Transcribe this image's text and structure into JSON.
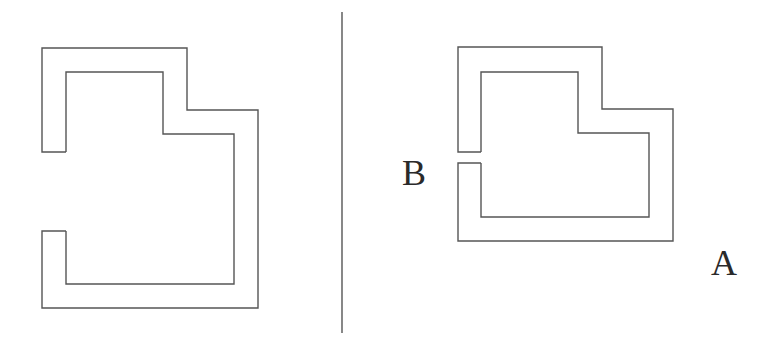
{
  "figure": {
    "width": 776,
    "height": 340,
    "background": "#ffffff",
    "stroke_color": "#555555",
    "label_color": "#2a2a2a"
  },
  "divider": {
    "x": 342,
    "y1": 12,
    "y2": 333
  },
  "shapes": [
    {
      "id": "left-channel-shape",
      "description": "Open-ended rectangular channel with a wide gap on the left side",
      "outer_points": "66,152 42,152 42,48 187,48 187,110 258,110 258,308 42,308 42,231 66,231",
      "inner_points": "66,152 66,72 163,72 163,134 234,134 234,284 66,284 66,231"
    },
    {
      "id": "right-channel-shape",
      "description": "Open-ended rectangular channel with a narrow gap on the left side",
      "outer_points": "481,152 458,152 458,47 602,47 602,109 673,109 673,241 458,241 458,163 481,163",
      "inner_points": "481,152 481,72 578,72 578,133 649,133 649,217 481,217 481,163"
    }
  ],
  "labels": [
    {
      "id": "label-b",
      "text": "B",
      "left": 402,
      "top": 155
    },
    {
      "id": "label-a",
      "text": "A",
      "left": 711,
      "top": 245
    }
  ]
}
